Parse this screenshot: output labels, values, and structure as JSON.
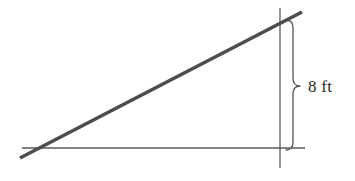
{
  "figure": {
    "kind": "geometry-diagram",
    "background_color": "#ffffff",
    "canvas": {
      "width": 355,
      "height": 181
    }
  },
  "styles": {
    "hypotenuse_color": "#4d4d4d",
    "hypotenuse_width": 3.6,
    "axis_color": "#59595b",
    "axis_width": 1.3,
    "brace_color": "#555557",
    "brace_width": 1.3,
    "label_color": "#2b2b2b"
  },
  "geometry": {
    "baseline": {
      "x1": 22,
      "y1": 148,
      "x2": 305,
      "y2": 148
    },
    "vertical": {
      "x1": 280,
      "y1": 8,
      "x2": 280,
      "y2": 168
    },
    "hypotenuse": {
      "x1": 20,
      "y1": 158,
      "x2": 302,
      "y2": 12
    },
    "brace": {
      "x_arm": 286,
      "x_spine": 293,
      "x_tip": 300,
      "y_top": 20,
      "y_bottom": 150,
      "y_tip": 86
    }
  },
  "labels": {
    "height": {
      "text": "8 ft",
      "value": 8,
      "unit": "ft",
      "measures": "vertical-height"
    }
  }
}
